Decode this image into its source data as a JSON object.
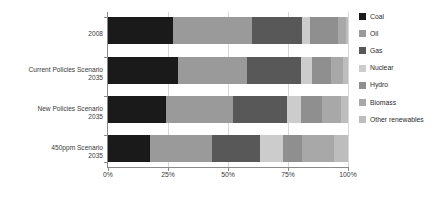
{
  "chart_data": {
    "type": "bar",
    "orientation": "horizontal",
    "stacked": true,
    "normalized": true,
    "title": "",
    "xlabel": "",
    "ylabel": "",
    "xlim": [
      0,
      100
    ],
    "grid": true,
    "legend_position": "right",
    "categories": [
      "2008",
      "Current Policies Scenario\n2035",
      "New Policies Scenario\n2035",
      "450ppm Scenario\n2035"
    ],
    "category_lines": [
      [
        "2008"
      ],
      [
        "Current Policies Scenario",
        "2035"
      ],
      [
        "New Policies Scenario",
        "2035"
      ],
      [
        "450ppm Scenario",
        "2035"
      ]
    ],
    "xticks": [
      0,
      25,
      50,
      75,
      100
    ],
    "xtick_labels": [
      "0%",
      "25%",
      "50%",
      "75%",
      "100%"
    ],
    "series": [
      {
        "name": "Coal",
        "color": "#1a1a1a",
        "values": [
          27,
          29,
          24,
          17.5
        ]
      },
      {
        "name": "Oil",
        "color": "#9a9a9a",
        "values": [
          33,
          29,
          28,
          26
        ]
      },
      {
        "name": "Gas",
        "color": "#585858",
        "values": [
          21,
          22.5,
          22.5,
          20
        ]
      },
      {
        "name": "Nuclear",
        "color": "#cccccc",
        "values": [
          3,
          4.5,
          6,
          9.5
        ]
      },
      {
        "name": "Hydro",
        "color": "#8f8f8f",
        "values": [
          12,
          8,
          8.5,
          8
        ]
      },
      {
        "name": "Biomass",
        "color": "#a8a8a8",
        "values": [
          3,
          5,
          8,
          13
        ]
      },
      {
        "name": "Other renewables",
        "color": "#bdbdbd",
        "values": [
          1,
          2,
          3,
          6
        ]
      }
    ]
  },
  "legend": {
    "items": [
      {
        "label": "Coal",
        "color": "#1a1a1a"
      },
      {
        "label": "Oil",
        "color": "#9a9a9a"
      },
      {
        "label": "Gas",
        "color": "#585858"
      },
      {
        "label": "Nuclear",
        "color": "#cccccc"
      },
      {
        "label": "Hydro",
        "color": "#8f8f8f"
      },
      {
        "label": "Biomass",
        "color": "#a8a8a8"
      },
      {
        "label": "Other renewables",
        "color": "#bdbdbd"
      }
    ]
  }
}
